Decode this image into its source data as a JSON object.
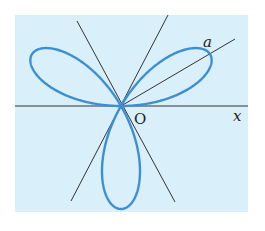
{
  "figure": {
    "curve_type": "polar rose",
    "petals": 3,
    "labels": {
      "origin": "O",
      "x_axis": "x",
      "radius": "a"
    },
    "colors": {
      "background": "#ffffff",
      "panel": "#d9f0fb",
      "curve": "#3d8fd4",
      "lines": "#333333",
      "text": "#222222"
    },
    "lines": [
      {
        "name": "x-axis",
        "angle_deg": 0
      },
      {
        "name": "tangent-line-60",
        "angle_deg": 60
      },
      {
        "name": "tangent-line-120",
        "angle_deg": 120
      },
      {
        "name": "radius-line-a",
        "angle_deg": 30
      }
    ]
  }
}
